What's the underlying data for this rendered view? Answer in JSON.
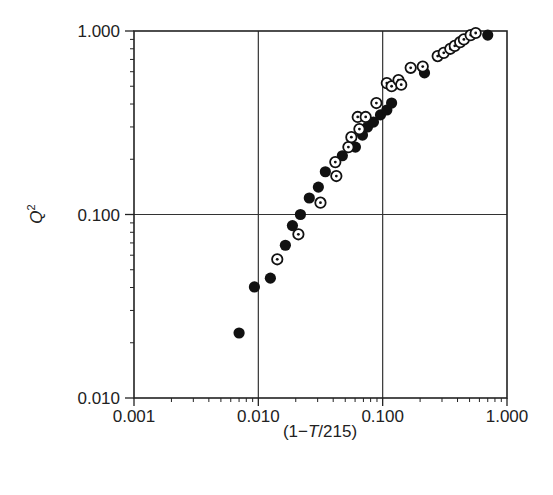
{
  "chart_data": {
    "type": "scatter",
    "title": "",
    "xlabel": "(1−T/215)",
    "xlabel_parts": [
      "(1−",
      "T",
      "/215)"
    ],
    "ylabel": "Q²",
    "ylabel_parts": [
      "Q",
      "2"
    ],
    "x_scale": "log",
    "y_scale": "log",
    "xlim": [
      0.001,
      1.0
    ],
    "ylim": [
      0.01,
      1.0
    ],
    "x_ticks": [
      "0.001",
      "0.010",
      "0.100",
      "1.000"
    ],
    "y_ticks": [
      "0.010",
      "0.100",
      "1.000"
    ],
    "grid": true,
    "legend": null,
    "series": [
      {
        "name": "filled circles",
        "marker": "filled-circle",
        "color": "#111111",
        "points": [
          [
            0.007,
            0.0226
          ],
          [
            0.0093,
            0.0403
          ],
          [
            0.0125,
            0.045
          ],
          [
            0.0165,
            0.068
          ],
          [
            0.0188,
            0.087
          ],
          [
            0.0218,
            0.1
          ],
          [
            0.0257,
            0.123
          ],
          [
            0.0304,
            0.141
          ],
          [
            0.0346,
            0.171
          ],
          [
            0.0474,
            0.209
          ],
          [
            0.0604,
            0.233
          ],
          [
            0.0688,
            0.271
          ],
          [
            0.0755,
            0.3
          ],
          [
            0.0843,
            0.319
          ],
          [
            0.096,
            0.349
          ],
          [
            0.108,
            0.371
          ],
          [
            0.118,
            0.405
          ],
          [
            0.217,
            0.591
          ],
          [
            0.7,
            0.95
          ]
        ]
      },
      {
        "name": "open circles with dot",
        "marker": "dotted-open-circle",
        "color": "#111111",
        "points": [
          [
            0.0142,
            0.057
          ],
          [
            0.021,
            0.078
          ],
          [
            0.0316,
            0.116
          ],
          [
            0.0424,
            0.162
          ],
          [
            0.0416,
            0.193
          ],
          [
            0.053,
            0.233
          ],
          [
            0.056,
            0.264
          ],
          [
            0.065,
            0.292
          ],
          [
            0.063,
            0.34
          ],
          [
            0.073,
            0.34
          ],
          [
            0.089,
            0.405
          ],
          [
            0.108,
            0.52
          ],
          [
            0.118,
            0.5
          ],
          [
            0.134,
            0.54
          ],
          [
            0.141,
            0.51
          ],
          [
            0.168,
            0.63
          ],
          [
            0.21,
            0.64
          ],
          [
            0.277,
            0.73
          ],
          [
            0.31,
            0.76
          ],
          [
            0.35,
            0.8
          ],
          [
            0.38,
            0.83
          ],
          [
            0.42,
            0.87
          ],
          [
            0.45,
            0.9
          ],
          [
            0.51,
            0.95
          ],
          [
            0.56,
            0.975
          ]
        ]
      }
    ]
  },
  "plot_area": {
    "left": 134,
    "top": 31,
    "right": 507,
    "bottom": 398
  }
}
